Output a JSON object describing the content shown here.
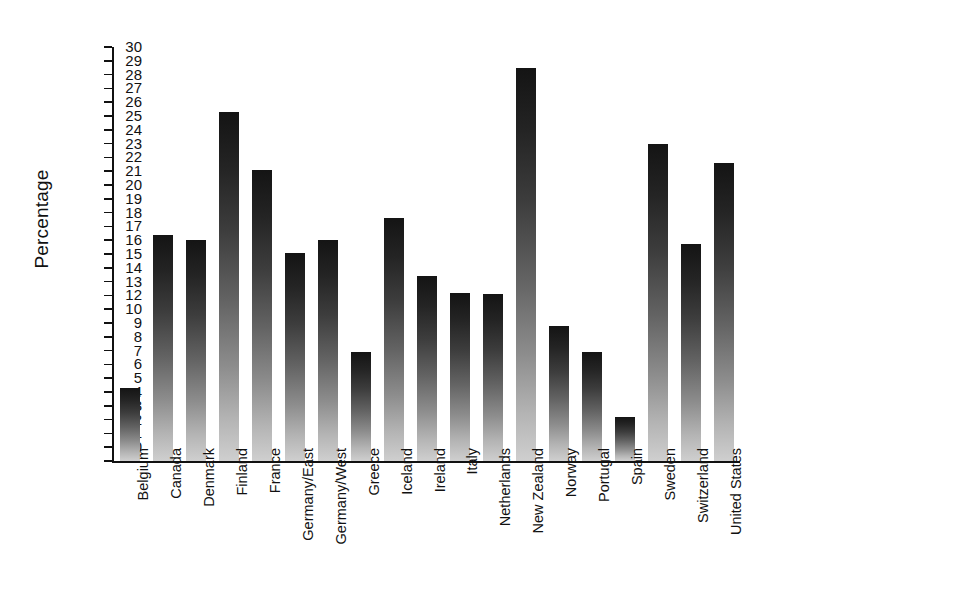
{
  "chart_data": {
    "type": "bar",
    "title": "",
    "subtitle": "",
    "xlabel": "",
    "ylabel": "Percentage",
    "ylim": [
      0,
      30
    ],
    "grid": false,
    "legend": null,
    "orientation": "vertical",
    "bar_style": "vertical grayscale gradient, dark at top fading to light gray at bottom",
    "y_ticks": [
      "30",
      "29",
      "28",
      "27",
      "26",
      "25",
      "24",
      "23",
      "22",
      "21",
      "20",
      "19",
      "18",
      "17",
      "16",
      "15",
      "14",
      "13",
      "12",
      "10",
      "9",
      "8",
      "7",
      "6",
      "5",
      "4",
      "3",
      "2",
      "1",
      "0"
    ],
    "y_tick_values": [
      30,
      29,
      28,
      27,
      26,
      25,
      24,
      23,
      22,
      21,
      20,
      19,
      18,
      17,
      16,
      15,
      14,
      13,
      12,
      11,
      10,
      9,
      8,
      7,
      6,
      5,
      4,
      3,
      2,
      1,
      0
    ],
    "categories": [
      "Belgium",
      "Canada",
      "Denmark",
      "Finland",
      "France",
      "Germany/East",
      "Germany/West",
      "Greece",
      "Iceland",
      "Ireland",
      "Italy",
      "Netherlands",
      "New Zealand",
      "Norway",
      "Portugal",
      "Spain",
      "Sweden",
      "Switzerland",
      "United States"
    ],
    "values": [
      5.3,
      16.4,
      16.0,
      25.3,
      21.1,
      15.1,
      16.0,
      7.9,
      17.6,
      13.4,
      12.2,
      12.1,
      28.5,
      9.8,
      7.9,
      3.2,
      23.0,
      15.7,
      21.6
    ],
    "colors": {
      "bar_top": "#141414",
      "bar_bottom": "#cfcfcf",
      "axis": "#111111",
      "background": "#ffffff",
      "text": "#111111"
    }
  }
}
